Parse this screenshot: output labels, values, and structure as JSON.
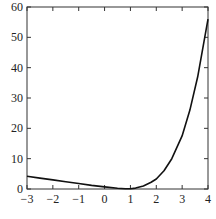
{
  "chart_data": {
    "type": "line",
    "title": "",
    "xlabel": "",
    "ylabel": "",
    "xlim": [
      -3,
      4
    ],
    "ylim": [
      0,
      60
    ],
    "grid": false,
    "legend": null,
    "x_ticks": [
      -3,
      -2,
      -1,
      0,
      1,
      2,
      3,
      4
    ],
    "y_ticks": [
      0,
      10,
      20,
      30,
      40,
      50,
      60
    ],
    "x_tick_labels": [
      "−3",
      "−2",
      "−1",
      "0",
      "1",
      "2",
      "3",
      "4"
    ],
    "y_tick_labels": [
      "0",
      "10",
      "20",
      "30",
      "40",
      "50",
      "60"
    ],
    "series": [
      {
        "name": "curve",
        "color": "#111111",
        "x": [
          -3,
          -2.5,
          -2,
          -1.5,
          -1,
          -0.5,
          0,
          0.5,
          0.8,
          1,
          1.2,
          1.5,
          1.8,
          2,
          2.3,
          2.6,
          3,
          3.3,
          3.6,
          4
        ],
        "y": [
          4.2,
          3.6,
          3.0,
          2.4,
          1.8,
          1.2,
          0.7,
          0.25,
          0.1,
          0.1,
          0.3,
          1.0,
          2.2,
          3.3,
          6.0,
          10.0,
          17.5,
          26.0,
          37.0,
          56.0
        ]
      }
    ]
  }
}
